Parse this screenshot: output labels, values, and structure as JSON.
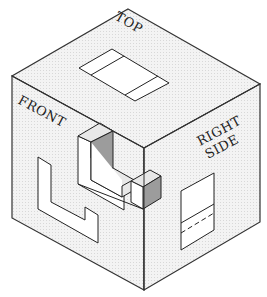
{
  "figure": {
    "labels": {
      "top": "TOP",
      "front": "FRONT",
      "right_line1": "RIGHT",
      "right_line2": "SIDE"
    },
    "colors": {
      "face_fill": "#f1f1f1",
      "line": "#333333",
      "projection_fill": "#ffffff",
      "object_light": "#e6e6e6",
      "object_dark": "#9a9a9a"
    }
  }
}
